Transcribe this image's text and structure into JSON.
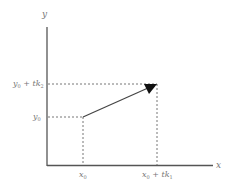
{
  "diagram": {
    "axes": {
      "x_label": "x",
      "y_label": "y"
    },
    "points": {
      "start": {
        "x_label": "x",
        "x_sub": "0",
        "y_label": "y",
        "y_sub": "0"
      },
      "end": {
        "x_label_main": "x",
        "x_label_sub": "0",
        "x_label_rest": " + tk",
        "x_label_rest_sub": "1",
        "y_label_main": "y",
        "y_label_sub": "0",
        "y_label_rest": " + tk",
        "y_label_rest_sub": "2"
      }
    },
    "colors": {
      "axis": "#555555",
      "arrow": "#444444",
      "dashed": "#666666",
      "text": "#777777"
    }
  }
}
